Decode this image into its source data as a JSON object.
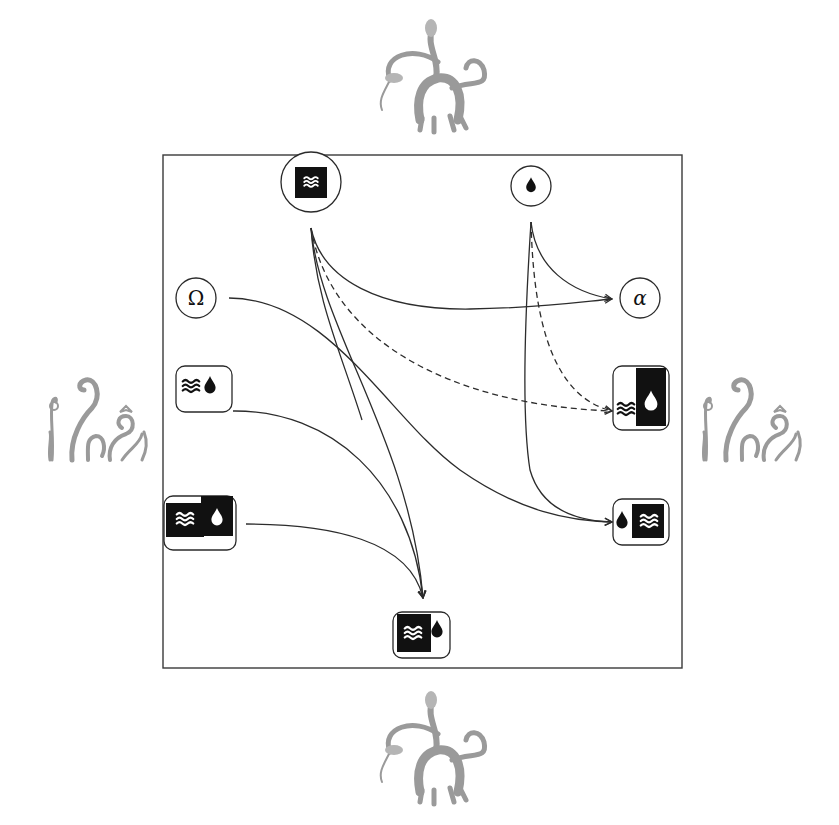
{
  "diagram": {
    "frame": {
      "x": 163,
      "y": 155,
      "width": 519,
      "height": 513
    },
    "colors": {
      "stroke": "#2c2c2c",
      "fill_dark": "#111111",
      "background": "#ffffff",
      "decoration": "#9a9a9a"
    },
    "nodes": [
      {
        "id": "top-waves",
        "shape": "circle",
        "icons": [
          "waves-square-icon"
        ],
        "label": "≈",
        "x": 311,
        "y": 182
      },
      {
        "id": "top-drop",
        "shape": "circle",
        "icons": [
          "drop-icon"
        ],
        "label": "",
        "x": 531,
        "y": 186
      },
      {
        "id": "left-omega",
        "shape": "circle",
        "icons": [],
        "label": "Ω",
        "x": 196,
        "y": 298
      },
      {
        "id": "left-waves-drop",
        "shape": "rounded-box",
        "icons": [
          "waves-icon",
          "drop-icon"
        ],
        "label": "≈",
        "x": 196,
        "y": 384
      },
      {
        "id": "left-waves-drop-dark",
        "shape": "rounded-box",
        "icons": [
          "waves-square-icon",
          "drop-square-icon"
        ],
        "label": "≈",
        "x": 200,
        "y": 521
      },
      {
        "id": "right-alpha",
        "shape": "circle",
        "icons": [],
        "label": "α",
        "x": 640,
        "y": 298
      },
      {
        "id": "right-waves-drop",
        "shape": "rounded-box",
        "icons": [
          "waves-icon",
          "drop-square-icon"
        ],
        "label": "≈",
        "x": 640,
        "y": 384
      },
      {
        "id": "right-drop-waves",
        "shape": "rounded-box",
        "icons": [
          "drop-icon",
          "waves-square-icon"
        ],
        "label": "≈",
        "x": 640,
        "y": 521
      },
      {
        "id": "bottom-waves-drop",
        "shape": "rounded-box",
        "icons": [
          "waves-square-icon",
          "drop-icon"
        ],
        "label": "≈",
        "x": 423,
        "y": 632
      }
    ],
    "edges": [
      {
        "from": "top-waves",
        "to": "right-alpha",
        "style": "solid"
      },
      {
        "from": "top-drop",
        "to": "right-alpha",
        "style": "solid"
      },
      {
        "from": "top-waves",
        "to": "right-waves-drop",
        "style": "dashed"
      },
      {
        "from": "top-drop",
        "to": "right-waves-drop",
        "style": "dashed"
      },
      {
        "from": "left-omega",
        "to": "right-drop-waves",
        "style": "solid"
      },
      {
        "from": "top-drop",
        "to": "right-drop-waves",
        "style": "solid"
      },
      {
        "from": "top-waves",
        "to": "bottom-waves-drop",
        "style": "solid"
      },
      {
        "from": "left-waves-drop",
        "to": "bottom-waves-drop",
        "style": "solid"
      },
      {
        "from": "left-waves-drop-dark",
        "to": "bottom-waves-drop",
        "style": "solid"
      }
    ],
    "decorations": [
      {
        "id": "top-creature",
        "kind": "serpent-beast-sketch",
        "position": "top"
      },
      {
        "id": "bottom-creature",
        "kind": "serpent-beast-sketch",
        "position": "bottom"
      },
      {
        "id": "left-tentacles",
        "kind": "tentacles-sketch",
        "position": "left"
      },
      {
        "id": "right-tentacles",
        "kind": "tentacles-sketch",
        "position": "right"
      }
    ]
  },
  "labels": {
    "omega": "Ω",
    "alpha": "α",
    "waves": "≈"
  }
}
